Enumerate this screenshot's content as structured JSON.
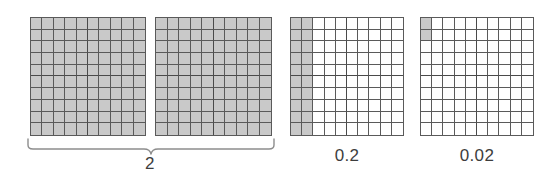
{
  "figure": {
    "background_color": "#ffffff",
    "shaded_color": "#c9c9c9",
    "gridline_color": "#5a5a5a",
    "label_color": "#3d3d3d"
  },
  "chart_data": {
    "type": "grid-area-model",
    "title": "",
    "xlabel": "",
    "ylabel": "",
    "grid_rows": 10,
    "grid_cols": 10,
    "cells_per_grid": 100,
    "groups": [
      {
        "id": "group-whole",
        "label": "2",
        "label_style": "brace",
        "grids": [
          {
            "id": "grid-1",
            "shaded_cells": 100,
            "shaded_pattern": "all",
            "fraction": 1
          },
          {
            "id": "grid-2",
            "shaded_cells": 100,
            "shaded_pattern": "all",
            "fraction": 1
          }
        ],
        "value": 2
      },
      {
        "id": "group-tenths",
        "label": "0.2",
        "label_style": "plain",
        "grids": [
          {
            "id": "grid-3",
            "shaded_cells": 20,
            "shaded_pattern": "first-2-columns",
            "fraction": 0.2
          }
        ],
        "value": 0.2
      },
      {
        "id": "group-hundredths",
        "label": "0.02",
        "label_style": "plain",
        "grids": [
          {
            "id": "grid-4",
            "shaded_cells": 2,
            "shaded_pattern": "col-1-rows-1-2",
            "fraction": 0.02
          }
        ],
        "value": 0.02
      }
    ],
    "labels": [
      "2",
      "0.2",
      "0.02"
    ],
    "values": [
      2,
      0.2,
      0.02
    ]
  },
  "labels": {
    "whole": "2",
    "tenths": "0.2",
    "hundredths": "0.02"
  }
}
